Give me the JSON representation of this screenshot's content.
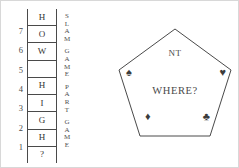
{
  "ladder": {
    "numbers": [
      "7",
      "6",
      "5",
      "4",
      "3",
      "2",
      "1"
    ],
    "steps": [
      {
        "label": "H"
      },
      {
        "label": "O"
      },
      {
        "label": "W"
      },
      {
        "label": ""
      },
      {
        "label": "H"
      },
      {
        "label": "I"
      },
      {
        "label": "G"
      },
      {
        "label": "H"
      }
    ],
    "tail": "?"
  },
  "side_text": {
    "words": [
      {
        "text": "SLAM",
        "chars": [
          "S",
          "L",
          "A",
          "M"
        ]
      },
      {
        "text": "GAME",
        "chars": [
          "G",
          "A",
          "M",
          "E"
        ]
      },
      {
        "text": "PART",
        "chars": [
          "P",
          "A",
          "R",
          "T"
        ]
      },
      {
        "text": "GAME",
        "chars": [
          "G",
          "A",
          "M",
          "E"
        ]
      }
    ]
  },
  "pentagon": {
    "top_label": "NT",
    "center_label": "WHERE?",
    "suits": [
      {
        "name": "spade-suit",
        "glyph": "♠"
      },
      {
        "name": "heart-suit",
        "glyph": "♥"
      },
      {
        "name": "diamond-suit",
        "glyph": "♦"
      },
      {
        "name": "club-suit",
        "glyph": "♣"
      }
    ]
  },
  "colors": {
    "ink": "#4a4a4a",
    "background": "#ffffff",
    "border": "#d8d8d8"
  }
}
